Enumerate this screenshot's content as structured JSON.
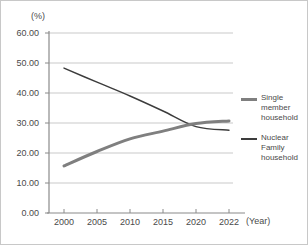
{
  "chart_data": {
    "type": "line",
    "title": "",
    "subtitle": "",
    "xlabel": "(Year)",
    "ylabel": "(%)",
    "categories": [
      "2000",
      "2005",
      "2010",
      "2015",
      "2020",
      "2022"
    ],
    "x_tick_labels": [
      "2000",
      "2005",
      "2010",
      "2015",
      "2020",
      "2022"
    ],
    "y_tick_labels": [
      "0.00",
      "10.00",
      "20.00",
      "30.00",
      "40.00",
      "50.00",
      "60.00"
    ],
    "ylim": [
      0,
      60
    ],
    "y_tick_step": 10,
    "grid": "horizontal",
    "legend_position": "right",
    "series": [
      {
        "name": "Single member household",
        "legend_label": "Single\nmember\nhousehold",
        "color": "#7f7f7f",
        "line_width": 3,
        "values": [
          15.7,
          20.5,
          24.7,
          27.3,
          29.8,
          30.7
        ]
      },
      {
        "name": "Nuclear Family household",
        "legend_label": "Nuclear\nFamily\nhousehold",
        "color": "#3c3c3c",
        "line_width": 1.4,
        "values": [
          48.3,
          43.6,
          39.0,
          34.0,
          28.8,
          27.6
        ]
      }
    ]
  },
  "axes": {
    "y_unit": "(%)",
    "x_unit": "(Year)",
    "y_ticks": [
      "60.00",
      "50.00",
      "40.00",
      "30.00",
      "20.00",
      "10.00",
      "0.00"
    ],
    "x_ticks": [
      "2000",
      "2005",
      "2010",
      "2015",
      "2020",
      "2022"
    ]
  },
  "legend": {
    "items": [
      {
        "label_line1": "Single",
        "label_line2": "member",
        "label_line3": "household",
        "color": "#7f7f7f",
        "style": "thick"
      },
      {
        "label_line1": "Nuclear",
        "label_line2": "Family",
        "label_line3": "household",
        "color": "#3c3c3c",
        "style": "thin"
      }
    ]
  },
  "colors": {
    "grid": "#c9c9c9",
    "axis": "#8a8a8a",
    "text": "#4a4a4a",
    "border": "#c8c8c8",
    "background": "#ffffff"
  }
}
